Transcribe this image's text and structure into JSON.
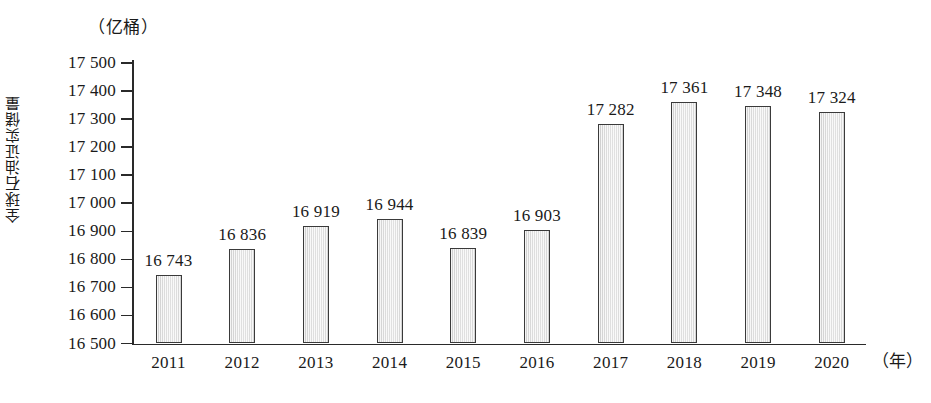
{
  "chart_data": {
    "type": "bar",
    "title": "",
    "subtitle": "",
    "xlabel": "（年）",
    "ylabel": "全球石油证实储量",
    "unit_caption": "（亿桶）",
    "categories": [
      "2011",
      "2012",
      "2013",
      "2014",
      "2015",
      "2016",
      "2017",
      "2018",
      "2019",
      "2020"
    ],
    "values": [
      16743,
      16836,
      16919,
      16944,
      16839,
      16903,
      17282,
      17361,
      17348,
      17324
    ],
    "value_labels": [
      "16 743",
      "16 836",
      "16 919",
      "16 944",
      "16 839",
      "16 903",
      "17 282",
      "17 361",
      "17 348",
      "17 324"
    ],
    "ylim": [
      16500,
      17500
    ],
    "ytick_values": [
      17500,
      17400,
      17300,
      17200,
      17100,
      17000,
      16900,
      16800,
      16700,
      16600,
      16500
    ],
    "ytick_labels": [
      "17 500",
      "17 400",
      "17 300",
      "17 200",
      "17 100",
      "17 000",
      "16 900",
      "16 800",
      "16 700",
      "16 600",
      "16 500"
    ],
    "ytick_step": 100,
    "grid": false,
    "legend": null,
    "legend_position": "none",
    "bar_fill_color": "#e2e2e2",
    "bar_border_color": "#3a3a3a",
    "axis_color": "#2a2a2a",
    "background_color": "#ffffff",
    "text_color": "#1a1a1a"
  }
}
